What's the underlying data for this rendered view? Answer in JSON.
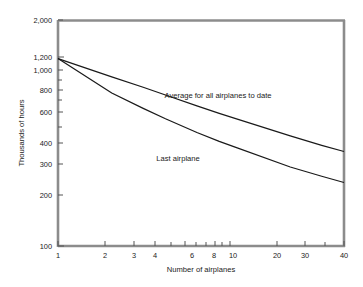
{
  "chart_data": {
    "type": "line",
    "title": "",
    "xlabel": "Number of airplanes",
    "ylabel": "Thousands of hours",
    "xscale": "log",
    "yscale": "log",
    "xlim": [
      1,
      40
    ],
    "ylim": [
      100,
      2000
    ],
    "grid": false,
    "legend_position": "inline-annotations",
    "xticks": [
      1,
      2,
      3,
      4,
      6,
      8,
      10,
      20,
      30,
      40
    ],
    "xticklabels": [
      "1",
      "2",
      "3",
      "4",
      "6",
      "8",
      "10",
      "20",
      "30",
      "40"
    ],
    "yticks": [
      100,
      200,
      300,
      400,
      600,
      800,
      1000,
      1200,
      2000
    ],
    "yticklabels": [
      "100",
      "200",
      "300",
      "400",
      "600",
      "800",
      "1,000",
      "1,200",
      "2,000"
    ],
    "series": [
      {
        "name": "Average for all airplanes to date",
        "label": "Average for all airplanes to date",
        "x": [
          1,
          2,
          3,
          4,
          6,
          8,
          10,
          20,
          30,
          40
        ],
        "values": [
          1200,
          940,
          820,
          740,
          640,
          580,
          540,
          430,
          380,
          350
        ]
      },
      {
        "name": "Last airplane",
        "label": "Last airplane",
        "x": [
          1,
          2,
          3,
          4,
          6,
          8,
          10,
          20,
          30,
          40
        ],
        "values": [
          1200,
          760,
          620,
          540,
          450,
          400,
          368,
          285,
          252,
          232
        ]
      }
    ],
    "annotations": [
      {
        "text": "Average for all airplanes to date",
        "x": 13,
        "y": 690
      },
      {
        "text": "Last airplane",
        "x": 5.2,
        "y": 318
      }
    ]
  },
  "axis": {
    "y_title": "Thousands of hours",
    "x_title": "Number of airplanes",
    "frame_color": "#8c8c8c",
    "line_color": "#1a1a1a"
  },
  "yticklabels": {
    "t2000": "2,000",
    "t1200": "1,200",
    "t1000": "1,000",
    "t800": "800",
    "t600": "600",
    "t400": "400",
    "t300": "300",
    "t200": "200",
    "t100": "100"
  },
  "xticklabels": {
    "t1": "1",
    "t2": "2",
    "t3": "3",
    "t4": "4",
    "t6": "6",
    "t8": "8",
    "t10": "10",
    "t20": "20",
    "t30": "30",
    "t40": "40"
  },
  "series_labels": {
    "average": "Average for all airplanes to date",
    "last": "Last airplane"
  }
}
